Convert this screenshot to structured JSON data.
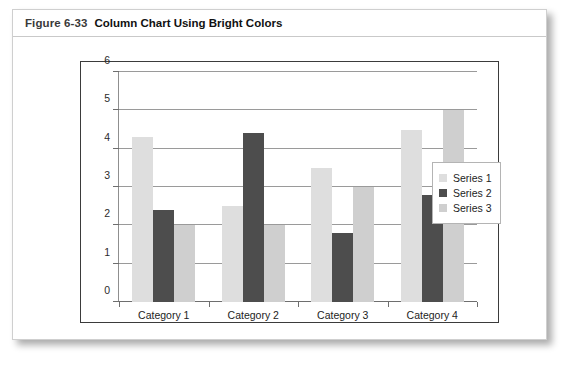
{
  "figure": {
    "number": "Figure 6-33",
    "title": "Column Chart Using Bright Colors"
  },
  "chart_data": {
    "type": "bar",
    "title": "",
    "xlabel": "",
    "ylabel": "",
    "ylim": [
      0,
      6
    ],
    "yticks": [
      0,
      1,
      2,
      3,
      4,
      5,
      6
    ],
    "ytick_labels": [
      "0",
      "1",
      "2",
      "3",
      "4",
      "5",
      "6"
    ],
    "grid": true,
    "legend_position": "right",
    "categories": [
      "Category 1",
      "Category 2",
      "Category 3",
      "Category 4"
    ],
    "series": [
      {
        "name": "Series 1",
        "color": "#dedede",
        "values": [
          4.3,
          2.5,
          3.5,
          4.5
        ]
      },
      {
        "name": "Series 2",
        "color": "#4d4d4d",
        "values": [
          2.4,
          4.4,
          1.8,
          2.8
        ]
      },
      {
        "name": "Series 3",
        "color": "#cfcfcf",
        "values": [
          2.0,
          2.0,
          3.0,
          5.0
        ]
      }
    ]
  }
}
